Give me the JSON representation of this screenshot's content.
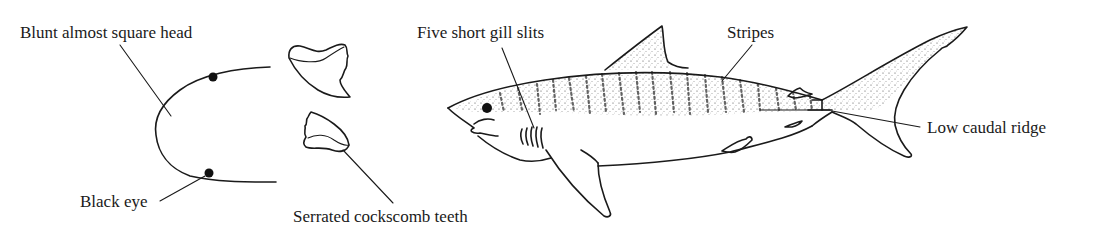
{
  "figure": {
    "background": "#ffffff",
    "ink_color": "#1a1a1a"
  },
  "labels": {
    "head": "Blunt almost square head",
    "eye": "Black eye",
    "teeth": "Serrated cockscomb teeth",
    "gills": "Five short gill slits",
    "stripes": "Stripes",
    "ridge": "Low caudal ridge"
  },
  "panels": [
    {
      "id": "head-outline",
      "description": "Head seen from below, showing blunt, almost square snout and black eyes"
    },
    {
      "id": "teeth",
      "description": "Two serrated cockscomb-shaped teeth"
    },
    {
      "id": "shark-side-view",
      "description": "Side view of tiger shark with stripes, five gill slits and low caudal ridge"
    }
  ]
}
